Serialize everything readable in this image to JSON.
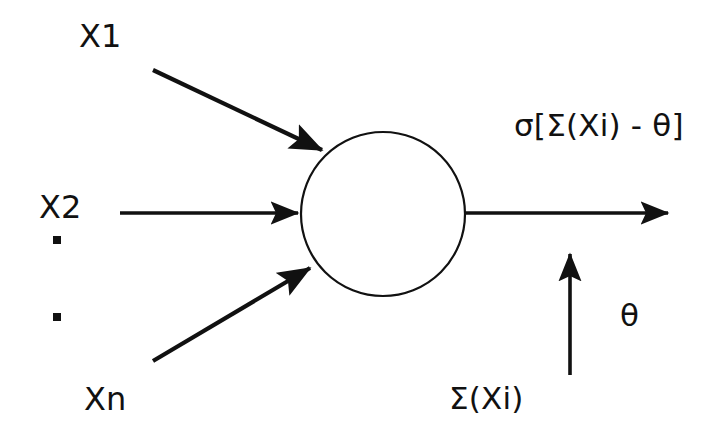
{
  "diagram": {
    "colors": {
      "stroke": "#111111",
      "background": "#ffffff"
    },
    "inputs": [
      {
        "id": "x1",
        "label": "X1"
      },
      {
        "id": "x2",
        "label": "X2"
      },
      {
        "id": "xn",
        "label": "Xn"
      }
    ],
    "ellipsis": {
      "symbol": "▪",
      "count": 2
    },
    "body": {
      "shape": "circle",
      "label": ""
    },
    "output": {
      "label": "σ[Σ(Xi) - θ]"
    },
    "summation": {
      "label": "Σ(Xi)"
    },
    "threshold": {
      "label": "θ"
    }
  }
}
